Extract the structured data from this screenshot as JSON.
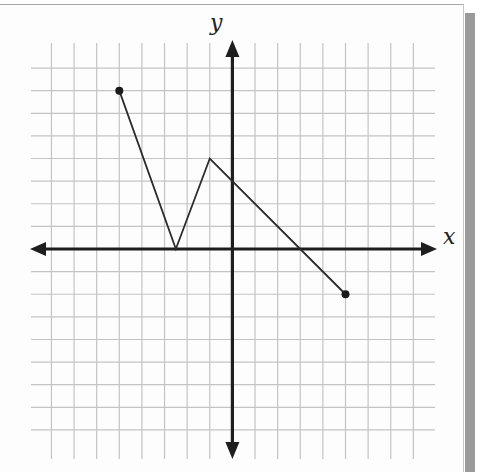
{
  "chart_data": {
    "type": "line",
    "title": "",
    "xlabel": "x",
    "ylabel": "y",
    "xlim": [
      -9,
      9
    ],
    "ylim": [
      -9,
      9
    ],
    "grid": true,
    "grid_step": 1,
    "legend": null,
    "series": [
      {
        "name": "piecewise",
        "points": [
          [
            -5,
            7
          ],
          [
            -2.5,
            0
          ],
          [
            -1,
            4
          ],
          [
            5,
            -2
          ]
        ],
        "endpoints": {
          "start": {
            "x": -5,
            "y": 7,
            "style": "closed-dot"
          },
          "end": {
            "x": 5,
            "y": -2,
            "style": "closed-dot"
          }
        }
      }
    ],
    "annotations": {
      "x_intercepts": [
        -2.5,
        3
      ],
      "y_intercept": 3
    }
  },
  "axes": {
    "x_label": "x",
    "y_label": "y"
  },
  "colors": {
    "grid": "#c4c4c4",
    "axis": "#1e1e1e",
    "line": "#2a2a2a",
    "shadow": "#9a9a9a"
  }
}
